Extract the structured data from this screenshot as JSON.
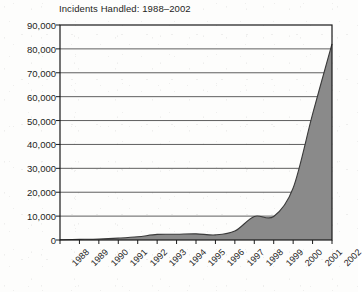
{
  "chart_data": {
    "type": "area",
    "title": "Incidents Handled: 1988–2002",
    "xlabel": "",
    "ylabel": "",
    "categories": [
      "1988",
      "1989",
      "1990",
      "1991",
      "1992",
      "1993",
      "1994",
      "1995",
      "1996",
      "1997",
      "1998",
      "1999",
      "2000",
      "2001",
      "2002"
    ],
    "values": [
      132,
      252,
      406,
      773,
      1334,
      2340,
      2412,
      2573,
      2134,
      3734,
      9859,
      9859,
      21756,
      52658,
      82094
    ],
    "ylim": [
      0,
      90000
    ],
    "yticks": [
      0,
      10000,
      20000,
      30000,
      40000,
      50000,
      60000,
      70000,
      80000,
      90000
    ],
    "ytick_labels": [
      "0",
      "10,000",
      "20,000",
      "30,000",
      "40,000",
      "50,000",
      "60,000",
      "70,000",
      "80,000",
      "90,000"
    ],
    "grid": true,
    "legend": false,
    "series": [
      {
        "name": "Incidents Handled",
        "values": [
          132,
          252,
          406,
          773,
          1334,
          2340,
          2412,
          2573,
          2134,
          3734,
          9859,
          9859,
          21756,
          52658,
          82094
        ]
      }
    ],
    "colors": {
      "fill": "#8a8a8a",
      "line": "#3a3a3a",
      "axis": "#1a1a1a",
      "grid": "#55555 5",
      "background": "#ffffff",
      "text": "#1d1d1d"
    }
  }
}
